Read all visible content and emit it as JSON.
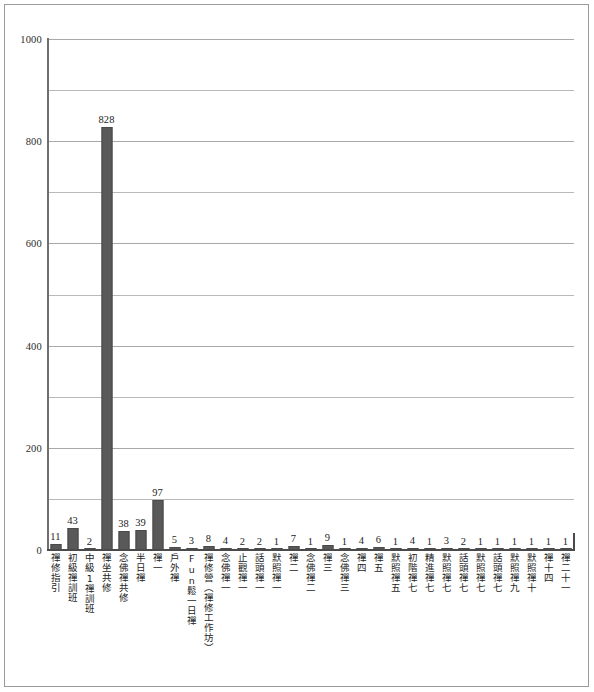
{
  "chart_data": {
    "type": "bar",
    "title": "",
    "subtitle": "",
    "xlabel": "",
    "ylabel": "",
    "ylim": [
      0,
      1000
    ],
    "ytick_labels": [
      "1000",
      "800",
      "600",
      "400",
      "200",
      "0"
    ],
    "ytick_values": [
      1000,
      800,
      600,
      400,
      200,
      0
    ],
    "minor_gridline_values": [
      900,
      700,
      500,
      300,
      100
    ],
    "grid": true,
    "legend": false,
    "bar_color": "#595959",
    "categories": [
      "禪修指引",
      "初級禪訓班",
      "中級1禪訓班",
      "禪坐共修",
      "念佛禪共修",
      "半日禪",
      "禪一",
      "戶外禪",
      "Fun鬆一日禪",
      "禪修營（禪修工作坊）",
      "念佛禪一",
      "止觀禪一",
      "話頭禪一",
      "默照禪一",
      "禪二",
      "念佛禪二",
      "禪三",
      "念佛禪三",
      "禪四",
      "禪五",
      "默照禪五",
      "初階禪七",
      "精進禪七",
      "默照禪七",
      "話頭禪七",
      "默照禪七",
      "話頭禪七",
      "默照禪九",
      "默照禪十",
      "禪十四",
      "禪二十一"
    ],
    "values": [
      11,
      43,
      2,
      828,
      38,
      39,
      97,
      5,
      3,
      8,
      4,
      2,
      2,
      1,
      7,
      1,
      9,
      1,
      4,
      6,
      1,
      4,
      1,
      3,
      2,
      1,
      1,
      1,
      1,
      1,
      1
    ],
    "data_labels": [
      "11",
      "43",
      "2",
      "828",
      "38",
      "39",
      "97",
      "5",
      "3",
      "8",
      "4",
      "2",
      "2",
      "1",
      "7",
      "1",
      "9",
      "1",
      "4",
      "6",
      "1",
      "4",
      "1",
      "3",
      "2",
      "1",
      "1",
      "1",
      "1",
      "1",
      "1"
    ]
  }
}
